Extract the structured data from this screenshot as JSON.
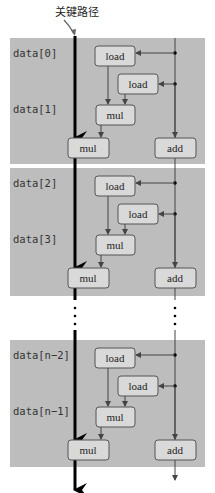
{
  "title": "关键路径",
  "colors": {
    "panel": "#bdbdbd",
    "box_fill": "#d9d9d9",
    "box_stroke": "#555555",
    "line": "#444444",
    "critical": "#000000"
  },
  "panels": [
    {
      "label_top": "data[0]",
      "label_bottom": "data[1]"
    },
    {
      "label_top": "data[2]",
      "label_bottom": "data[3]"
    },
    {
      "label_top": "data[n−2]",
      "label_bottom": "data[n−1]"
    }
  ],
  "ops": {
    "load": "load",
    "mul": "mul",
    "add": "add"
  },
  "ellipsis": "⋮"
}
